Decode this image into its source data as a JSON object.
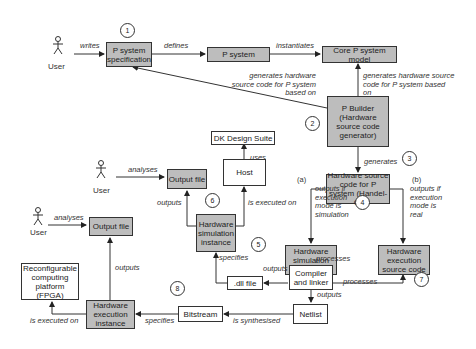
{
  "actors": [
    {
      "id": "user1",
      "label": "User"
    },
    {
      "id": "user2",
      "label": "User"
    },
    {
      "id": "user3",
      "label": "User"
    }
  ],
  "nodes": {
    "p_system_spec": "P system specification",
    "p_system": "P system",
    "core_model": "Core P system model",
    "p_builder": "P Builder (Hardware source code generator)",
    "hw_source": "Hardware source code for P system (Handel-C)",
    "dk_suite": "DK Design Suite",
    "host": "Host",
    "output_file_1": "Output file",
    "output_file_2": "Output file",
    "hw_sim_instance": "Hardware simulation instance",
    "hw_sim_source": "Hardware simulation source code",
    "hw_exec_source": "Hardware execution source code",
    "compiler": "Compiler and linker",
    "dll_file": ".dll file",
    "netlist": "Netlist",
    "bitstream": "Bitstream",
    "hw_exec_instance": "Hardware execution instance",
    "fpga": "Reconfigurable computing platform (FPGA)"
  },
  "edges": {
    "writes": "writes",
    "defines": "defines",
    "instantiates": "instantiates",
    "generates_left": "generates hardware source code for P system based on",
    "generates_right": "generates hardware source code for P system based on",
    "generates": "generates",
    "uses": "uses",
    "analyses_1": "analyses",
    "analyses_2": "analyses",
    "outputs_sim": "outputs",
    "is_executed_on_host": "is executed on",
    "branch_a": "(a)",
    "branch_b": "(b)",
    "outputs_if_sim": "outputs if execution mode is simulation",
    "outputs_if_real": "outputs if execution mode is real",
    "specifies_dll": "specifies",
    "outputs_dll": "outputs",
    "processes_sim": "processes",
    "processes_exec": "processes",
    "outputs_netlist": "outputs",
    "is_synthesised": "is synthesised",
    "specifies_bitstream": "specifies",
    "outputs_exec": "outputs",
    "is_executed_on_fpga": "is executed on"
  },
  "steps": [
    "1",
    "2",
    "3",
    "4",
    "5",
    "6",
    "7",
    "8"
  ]
}
